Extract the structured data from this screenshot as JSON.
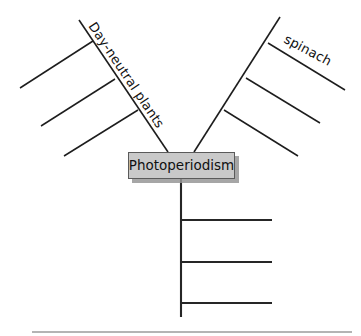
{
  "diagram": {
    "type": "concept-map",
    "title": "Photoperiodism",
    "center_node": {
      "label": "Photoperiodism",
      "fill_color": "#c9c9c9",
      "border_color": "#5a5a5a",
      "shadow_color": "#969696",
      "x": 128,
      "y": 152,
      "width": 107,
      "height": 27
    },
    "line_color": "#1d1d1d",
    "footer_rule_color": "#9b9b9b",
    "branches": [
      {
        "id": "left-branch",
        "name": "day-neutral-plants-branch",
        "label": "Day-neutral plants",
        "label_rotation_deg": 48,
        "direction": "upper-left",
        "main_line": {
          "x1": 79,
          "y1": 20,
          "x2": 168,
          "y2": 152
        },
        "sub_branches": [
          {
            "id": "left-sub-1",
            "label": "",
            "x1": 93,
            "y1": 41,
            "x2": 20,
            "y2": 88
          },
          {
            "id": "left-sub-2",
            "label": "",
            "x1": 115,
            "y1": 79,
            "x2": 41,
            "y2": 126
          },
          {
            "id": "left-sub-3",
            "label": "",
            "x1": 138,
            "y1": 110,
            "x2": 64,
            "y2": 156
          }
        ]
      },
      {
        "id": "right-branch",
        "name": "spinach-branch",
        "label": "",
        "direction": "upper-right",
        "main_line": {
          "x1": 280,
          "y1": 17,
          "x2": 194,
          "y2": 152
        },
        "sub_branches": [
          {
            "id": "right-sub-1",
            "label": "spinach",
            "label_rotation_deg": 25,
            "x1": 268,
            "y1": 43,
            "x2": 345,
            "y2": 90
          },
          {
            "id": "right-sub-2",
            "label": "",
            "x1": 246,
            "y1": 78,
            "x2": 320,
            "y2": 123
          },
          {
            "id": "right-sub-3",
            "label": "",
            "x1": 224,
            "y1": 110,
            "x2": 298,
            "y2": 156
          }
        ]
      },
      {
        "id": "bottom-branch",
        "name": "bottom-stem-branch",
        "label": "",
        "direction": "down",
        "main_line": {
          "x1": 181,
          "y1": 179,
          "x2": 181,
          "y2": 317
        },
        "sub_branches": [
          {
            "id": "bottom-sub-1",
            "label": "",
            "x1": 181,
            "y1": 220,
            "x2": 272,
            "y2": 220
          },
          {
            "id": "bottom-sub-2",
            "label": "",
            "x1": 181,
            "y1": 262,
            "x2": 272,
            "y2": 262
          },
          {
            "id": "bottom-sub-3",
            "label": "",
            "x1": 181,
            "y1": 303,
            "x2": 272,
            "y2": 303
          }
        ]
      }
    ],
    "footer_rule": {
      "x1": 32,
      "y1": 332,
      "x2": 352,
      "y2": 332
    }
  }
}
